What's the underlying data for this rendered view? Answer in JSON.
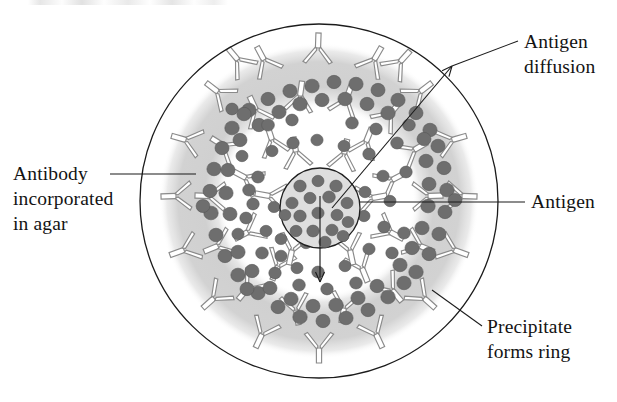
{
  "figure": {
    "width": 617,
    "height": 402,
    "background_color": "#ffffff"
  },
  "colors": {
    "plate_outline": "#1b1b1b",
    "agar_background": "#ffffff",
    "precipitate_ring": "#d4d4d4",
    "precipitate_ring_soft": "#dcdcdc",
    "well_fill": "#dedede",
    "well_outline": "#1f1f1f",
    "antigen_dot": "#6e6e6e",
    "antigen_dot_edge": "#575757",
    "antibody_stroke": "#8a8a8a",
    "antibody_fill": "#ffffff",
    "label_text": "#131313",
    "leader_line": "#1b1b1b"
  },
  "geometry": {
    "plate_center": {
      "x": 319,
      "y": 201
    },
    "plate_radius_x": 179,
    "plate_radius_y": 177,
    "ring_outer_radius_x": 148,
    "ring_outer_radius_y": 146,
    "ring_inner_radius_x": 104,
    "ring_inner_radius_y": 101,
    "well_center": {
      "x": 320,
      "y": 208
    },
    "well_radius_x": 40,
    "well_radius_y": 40
  },
  "labels": [
    {
      "id": "antigen-diffusion",
      "name": "label-antigen-diffusion",
      "lines": [
        "Antigen",
        "diffusion"
      ],
      "text_x": 524,
      "text_y": 48,
      "line_height": 25,
      "anchor": "start",
      "leader": {
        "x1": 518,
        "y1": 41,
        "x2": 452,
        "y2": 66
      }
    },
    {
      "id": "antibody-in-agar",
      "name": "label-antibody-incorporated-in-agar",
      "lines": [
        "Antibody",
        "incorporated",
        "in agar"
      ],
      "text_x": 13,
      "text_y": 180,
      "line_height": 25,
      "anchor": "start",
      "leader": {
        "x1": 110,
        "y1": 174,
        "x2": 196,
        "y2": 174
      }
    },
    {
      "id": "antigen",
      "name": "label-antigen",
      "lines": [
        "Antigen"
      ],
      "text_x": 531,
      "text_y": 208,
      "line_height": 25,
      "anchor": "start",
      "leader": {
        "x1": 525,
        "y1": 202,
        "x2": 360,
        "y2": 202
      }
    },
    {
      "id": "precipitate-forms-ring",
      "name": "label-precipitate-forms-ring",
      "lines": [
        "Precipitate",
        "forms ring"
      ],
      "text_x": 487,
      "text_y": 333,
      "line_height": 25,
      "anchor": "start",
      "leader": {
        "x1": 482,
        "y1": 326,
        "x2": 432,
        "y2": 290
      }
    }
  ],
  "diffusion_arrows": [
    {
      "name": "diffusion-arrow-upper-right",
      "x1": 332,
      "y1": 208,
      "x2": 452,
      "y2": 66,
      "head_size": 11,
      "description": "antigen diffusing outward toward upper right"
    },
    {
      "name": "diffusion-arrow-down",
      "x1": 320,
      "y1": 196,
      "x2": 320,
      "y2": 282,
      "head_size": 11,
      "description": "antigen diffusing downward from well"
    }
  ],
  "chart_data": {
    "type": "diagram",
    "elements": [
      {
        "name": "petri dish / agar plate",
        "role": "outer boundary circle"
      },
      {
        "name": "antibody incorporated in agar",
        "role": "Y-shaped antibody symbols distributed over plate"
      },
      {
        "name": "antigen",
        "role": "dark round dots diffusing from the central well"
      },
      {
        "name": "precipitate ring",
        "role": "light gray annulus of dense antigen-antibody complexes"
      },
      {
        "name": "antigen well",
        "role": "central circle loaded with antigen"
      }
    ],
    "antigen_dot_count": 118,
    "antibody_symbol_count": 46,
    "well_dot_count": 18
  },
  "antigen_dots": [
    {
      "x": 300,
      "y": 186,
      "r": 6.2
    },
    {
      "x": 318,
      "y": 181,
      "r": 6.0
    },
    {
      "x": 336,
      "y": 186,
      "r": 6.2
    },
    {
      "x": 292,
      "y": 203,
      "r": 6.1
    },
    {
      "x": 310,
      "y": 198,
      "r": 6.0
    },
    {
      "x": 329,
      "y": 197,
      "r": 6.3
    },
    {
      "x": 347,
      "y": 203,
      "r": 6.0
    },
    {
      "x": 300,
      "y": 216,
      "r": 6.2
    },
    {
      "x": 318,
      "y": 213,
      "r": 6.1
    },
    {
      "x": 337,
      "y": 215,
      "r": 6.0
    },
    {
      "x": 296,
      "y": 231,
      "r": 6.0
    },
    {
      "x": 313,
      "y": 231,
      "r": 6.2
    },
    {
      "x": 332,
      "y": 230,
      "r": 6.1
    },
    {
      "x": 348,
      "y": 222,
      "r": 5.9
    },
    {
      "x": 306,
      "y": 243,
      "r": 6.0
    },
    {
      "x": 325,
      "y": 242,
      "r": 6.1
    },
    {
      "x": 285,
      "y": 215,
      "r": 5.8
    },
    {
      "x": 343,
      "y": 236,
      "r": 5.9
    },
    {
      "x": 258,
      "y": 177,
      "r": 6.3
    },
    {
      "x": 253,
      "y": 204,
      "r": 6.2
    },
    {
      "x": 266,
      "y": 231,
      "r": 6.0
    },
    {
      "x": 281,
      "y": 256,
      "r": 6.1
    },
    {
      "x": 272,
      "y": 151,
      "r": 6.0
    },
    {
      "x": 293,
      "y": 143,
      "r": 6.2
    },
    {
      "x": 317,
      "y": 140,
      "r": 6.1
    },
    {
      "x": 344,
      "y": 146,
      "r": 6.0
    },
    {
      "x": 369,
      "y": 154,
      "r": 6.2
    },
    {
      "x": 383,
      "y": 176,
      "r": 6.1
    },
    {
      "x": 390,
      "y": 201,
      "r": 6.0
    },
    {
      "x": 384,
      "y": 227,
      "r": 6.2
    },
    {
      "x": 369,
      "y": 249,
      "r": 6.1
    },
    {
      "x": 345,
      "y": 266,
      "r": 6.0
    },
    {
      "x": 318,
      "y": 272,
      "r": 6.2
    },
    {
      "x": 297,
      "y": 268,
      "r": 6.0
    },
    {
      "x": 238,
      "y": 234,
      "r": 6.1
    },
    {
      "x": 242,
      "y": 156,
      "r": 6.0
    },
    {
      "x": 312,
      "y": 86,
      "r": 7.2
    },
    {
      "x": 334,
      "y": 82,
      "r": 7.0
    },
    {
      "x": 356,
      "y": 84,
      "r": 7.1
    },
    {
      "x": 378,
      "y": 90,
      "r": 7.0
    },
    {
      "x": 290,
      "y": 91,
      "r": 7.1
    },
    {
      "x": 268,
      "y": 99,
      "r": 7.0
    },
    {
      "x": 249,
      "y": 110,
      "r": 7.2
    },
    {
      "x": 398,
      "y": 100,
      "r": 7.1
    },
    {
      "x": 416,
      "y": 113,
      "r": 7.0
    },
    {
      "x": 300,
      "y": 104,
      "r": 7.2
    },
    {
      "x": 322,
      "y": 100,
      "r": 7.0
    },
    {
      "x": 345,
      "y": 99,
      "r": 7.1
    },
    {
      "x": 367,
      "y": 104,
      "r": 7.0
    },
    {
      "x": 388,
      "y": 113,
      "r": 7.2
    },
    {
      "x": 279,
      "y": 112,
      "r": 7.1
    },
    {
      "x": 259,
      "y": 125,
      "r": 7.0
    },
    {
      "x": 430,
      "y": 130,
      "r": 7.1
    },
    {
      "x": 240,
      "y": 140,
      "r": 7.0
    },
    {
      "x": 232,
      "y": 128,
      "r": 7.2
    },
    {
      "x": 222,
      "y": 148,
      "r": 7.0
    },
    {
      "x": 214,
      "y": 169,
      "r": 7.1
    },
    {
      "x": 210,
      "y": 191,
      "r": 7.0
    },
    {
      "x": 211,
      "y": 213,
      "r": 7.2
    },
    {
      "x": 216,
      "y": 235,
      "r": 7.1
    },
    {
      "x": 225,
      "y": 256,
      "r": 7.0
    },
    {
      "x": 238,
      "y": 275,
      "r": 7.2
    },
    {
      "x": 203,
      "y": 206,
      "r": 6.9
    },
    {
      "x": 228,
      "y": 170,
      "r": 7.0
    },
    {
      "x": 226,
      "y": 193,
      "r": 7.1
    },
    {
      "x": 230,
      "y": 214,
      "r": 7.0
    },
    {
      "x": 238,
      "y": 252,
      "r": 7.1
    },
    {
      "x": 252,
      "y": 271,
      "r": 7.0
    },
    {
      "x": 244,
      "y": 114,
      "r": 7.1
    },
    {
      "x": 438,
      "y": 146,
      "r": 7.1
    },
    {
      "x": 444,
      "y": 168,
      "r": 7.0
    },
    {
      "x": 447,
      "y": 190,
      "r": 7.2
    },
    {
      "x": 445,
      "y": 212,
      "r": 7.0
    },
    {
      "x": 439,
      "y": 234,
      "r": 7.1
    },
    {
      "x": 429,
      "y": 254,
      "r": 7.0
    },
    {
      "x": 416,
      "y": 272,
      "r": 7.2
    },
    {
      "x": 424,
      "y": 139,
      "r": 7.0
    },
    {
      "x": 426,
      "y": 161,
      "r": 7.1
    },
    {
      "x": 429,
      "y": 184,
      "r": 7.0
    },
    {
      "x": 428,
      "y": 206,
      "r": 7.2
    },
    {
      "x": 422,
      "y": 228,
      "r": 7.1
    },
    {
      "x": 412,
      "y": 248,
      "r": 7.0
    },
    {
      "x": 400,
      "y": 265,
      "r": 7.1
    },
    {
      "x": 455,
      "y": 200,
      "r": 6.9
    },
    {
      "x": 258,
      "y": 293,
      "r": 7.1
    },
    {
      "x": 278,
      "y": 307,
      "r": 7.0
    },
    {
      "x": 300,
      "y": 317,
      "r": 7.2
    },
    {
      "x": 323,
      "y": 321,
      "r": 7.0
    },
    {
      "x": 346,
      "y": 318,
      "r": 7.1
    },
    {
      "x": 368,
      "y": 310,
      "r": 7.0
    },
    {
      "x": 388,
      "y": 297,
      "r": 7.2
    },
    {
      "x": 270,
      "y": 288,
      "r": 7.0
    },
    {
      "x": 291,
      "y": 299,
      "r": 7.1
    },
    {
      "x": 313,
      "y": 306,
      "r": 7.0
    },
    {
      "x": 336,
      "y": 305,
      "r": 7.2
    },
    {
      "x": 358,
      "y": 298,
      "r": 7.1
    },
    {
      "x": 377,
      "y": 286,
      "r": 7.0
    },
    {
      "x": 247,
      "y": 289,
      "r": 7.0
    },
    {
      "x": 404,
      "y": 283,
      "r": 7.1
    },
    {
      "x": 268,
      "y": 125,
      "r": 6.4
    },
    {
      "x": 292,
      "y": 120,
      "r": 6.2
    },
    {
      "x": 352,
      "y": 123,
      "r": 6.3
    },
    {
      "x": 376,
      "y": 129,
      "r": 6.2
    },
    {
      "x": 249,
      "y": 190,
      "r": 6.3
    },
    {
      "x": 246,
      "y": 218,
      "r": 6.2
    },
    {
      "x": 397,
      "y": 143,
      "r": 6.3
    },
    {
      "x": 406,
      "y": 172,
      "r": 6.2
    },
    {
      "x": 404,
      "y": 233,
      "r": 6.3
    },
    {
      "x": 392,
      "y": 253,
      "r": 6.2
    },
    {
      "x": 356,
      "y": 283,
      "r": 6.3
    },
    {
      "x": 327,
      "y": 289,
      "r": 6.2
    },
    {
      "x": 299,
      "y": 285,
      "r": 6.3
    },
    {
      "x": 275,
      "y": 273,
      "r": 6.2
    },
    {
      "x": 262,
      "y": 253,
      "r": 6.3
    },
    {
      "x": 232,
      "y": 109,
      "r": 6.2
    },
    {
      "x": 409,
      "y": 125,
      "r": 6.3
    },
    {
      "x": 274,
      "y": 207,
      "r": 5.9
    },
    {
      "x": 364,
      "y": 216,
      "r": 6.0
    },
    {
      "x": 365,
      "y": 192,
      "r": 6.0
    },
    {
      "x": 281,
      "y": 239,
      "r": 5.9
    }
  ],
  "antibodies": [
    {
      "x": 318,
      "y": 48,
      "rot": 2
    },
    {
      "x": 264,
      "y": 60,
      "rot": -28
    },
    {
      "x": 374,
      "y": 60,
      "rot": 30
    },
    {
      "x": 218,
      "y": 92,
      "rot": -52
    },
    {
      "x": 420,
      "y": 92,
      "rot": 52
    },
    {
      "x": 186,
      "y": 140,
      "rot": -74
    },
    {
      "x": 452,
      "y": 140,
      "rot": 74
    },
    {
      "x": 176,
      "y": 196,
      "rot": -92
    },
    {
      "x": 462,
      "y": 196,
      "rot": 92
    },
    {
      "x": 184,
      "y": 250,
      "rot": -110
    },
    {
      "x": 454,
      "y": 250,
      "rot": 110
    },
    {
      "x": 214,
      "y": 298,
      "rot": -132
    },
    {
      "x": 424,
      "y": 298,
      "rot": 132
    },
    {
      "x": 262,
      "y": 334,
      "rot": -155
    },
    {
      "x": 376,
      "y": 334,
      "rot": 155
    },
    {
      "x": 319,
      "y": 348,
      "rot": 180
    },
    {
      "x": 300,
      "y": 96,
      "rot": 8
    },
    {
      "x": 346,
      "y": 100,
      "rot": 20
    },
    {
      "x": 256,
      "y": 110,
      "rot": -25
    },
    {
      "x": 390,
      "y": 114,
      "rot": 40
    },
    {
      "x": 224,
      "y": 146,
      "rot": -58
    },
    {
      "x": 414,
      "y": 150,
      "rot": 60
    },
    {
      "x": 210,
      "y": 196,
      "rot": -88
    },
    {
      "x": 428,
      "y": 196,
      "rot": 88
    },
    {
      "x": 218,
      "y": 246,
      "rot": -112
    },
    {
      "x": 420,
      "y": 246,
      "rot": 112
    },
    {
      "x": 248,
      "y": 288,
      "rot": -140
    },
    {
      "x": 392,
      "y": 290,
      "rot": 140
    },
    {
      "x": 296,
      "y": 310,
      "rot": 170
    },
    {
      "x": 344,
      "y": 308,
      "rot": -170
    },
    {
      "x": 272,
      "y": 140,
      "rot": -18
    },
    {
      "x": 366,
      "y": 142,
      "rot": 22
    },
    {
      "x": 246,
      "y": 178,
      "rot": -62
    },
    {
      "x": 392,
      "y": 180,
      "rot": 62
    },
    {
      "x": 248,
      "y": 232,
      "rot": -118
    },
    {
      "x": 390,
      "y": 232,
      "rot": 118
    },
    {
      "x": 278,
      "y": 266,
      "rot": -158
    },
    {
      "x": 362,
      "y": 268,
      "rot": 158
    },
    {
      "x": 296,
      "y": 152,
      "rot": -10
    },
    {
      "x": 344,
      "y": 154,
      "rot": 12
    },
    {
      "x": 270,
      "y": 196,
      "rot": -80
    },
    {
      "x": 372,
      "y": 198,
      "rot": 80
    },
    {
      "x": 292,
      "y": 250,
      "rot": -168
    },
    {
      "x": 350,
      "y": 250,
      "rot": 168
    },
    {
      "x": 238,
      "y": 60,
      "rot": -40
    },
    {
      "x": 400,
      "y": 62,
      "rot": 42
    }
  ]
}
